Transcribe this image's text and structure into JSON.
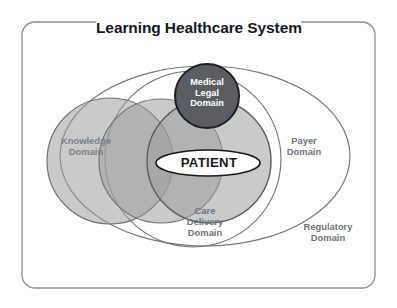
{
  "diagram": {
    "title": "Learning Healthcare System",
    "type": "venn-diagram",
    "background_color": "#ffffff",
    "frame": {
      "name": "outer-rounded-border",
      "stroke_color": "#8a8d93",
      "corner_radius": 14
    },
    "center_element": {
      "label": "PATIENT",
      "shape": "ellipse",
      "fill_color": "#ffffff",
      "stroke_color": "#16181c",
      "text_color": "#17191d"
    },
    "domains": [
      {
        "id": "knowledge",
        "label": "Knowledge\nDomain",
        "line1": "Knowledge",
        "line2": "Domain",
        "shape": "circle",
        "fill_color": "#c6c6c6",
        "stroke_color": "#6f7378",
        "text_color": "#7b7f85"
      },
      {
        "id": "care-delivery",
        "label": "Care\nDelivery\nDomain",
        "line1": "Care",
        "line2": "Delivery",
        "line3": "Domain",
        "shape": "circle",
        "fill_color": "#c6c6c6",
        "stroke_color": "#6f7378",
        "text_color": "#6e7278"
      },
      {
        "id": "medical-legal",
        "label": "Medical\nLegal\nDomain",
        "line1": "Medical",
        "line2": "Legal",
        "line3": "Domain",
        "shape": "circle",
        "fill_color": "#5a5d62",
        "stroke_color": "#1d1f23",
        "text_color": "#ffffff"
      },
      {
        "id": "payer",
        "label": "Payer\nDomain",
        "line1": "Payer",
        "line2": "Domain",
        "shape": "circle",
        "fill_color": "none",
        "stroke_color": "#6f7378",
        "text_color": "#6e7278"
      },
      {
        "id": "regulatory",
        "label": "Regulatory\nDomain",
        "line1": "Regulatory",
        "line2": "Domain",
        "shape": "ellipse",
        "fill_color": "none",
        "stroke_color": "#75797f",
        "text_color": "#6e7278"
      }
    ]
  }
}
